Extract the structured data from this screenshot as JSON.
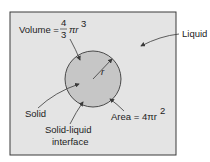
{
  "diagram": {
    "type": "solidification-nucleus",
    "colors": {
      "background": "#ffffff",
      "liquid_fill": "#e4e4e4",
      "solid_fill": "#c6c6c6",
      "stroke": "#3a3a3a",
      "text": "#222222"
    },
    "labels": {
      "volume_prefix": "Volume = ",
      "volume_num": "4",
      "volume_den": "3",
      "volume_suffix": "πr",
      "volume_exp": "3",
      "liquid": "Liquid",
      "radius": "r",
      "solid": "Solid",
      "interface_line1": "Solid-liquid",
      "interface_line2": "interface",
      "area_prefix": "Area = 4πr",
      "area_exp": "2"
    }
  }
}
